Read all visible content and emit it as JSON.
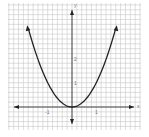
{
  "chart_data": {
    "type": "line",
    "title": "",
    "xlabel": "x",
    "ylabel": "y",
    "function": "y = x^2",
    "x": [
      -1.8,
      -1.5,
      -1.2,
      -1.0,
      -0.8,
      -0.6,
      -0.4,
      -0.2,
      0,
      0.2,
      0.4,
      0.6,
      0.8,
      1.0,
      1.2,
      1.5,
      1.8
    ],
    "series": [
      {
        "name": "y = x^2",
        "values": [
          3.24,
          2.25,
          1.44,
          1.0,
          0.64,
          0.36,
          0.16,
          0.04,
          0,
          0.04,
          0.16,
          0.36,
          0.64,
          1.0,
          1.44,
          2.25,
          3.24
        ]
      }
    ],
    "x_ticks": [
      "-1",
      "1"
    ],
    "y_ticks": [
      "1",
      "2"
    ],
    "xlim": [
      -2.6,
      2.8
    ],
    "ylim": [
      -0.9,
      4.3
    ],
    "grid": true,
    "grid_minor_step": 0.2,
    "arrows_on_curve_ends": true,
    "arrows_on_axes": true,
    "colors": {
      "curve": "#222222",
      "axes": "#333333",
      "grid": "#c8c8c8"
    }
  },
  "labels": {
    "x_axis": "x",
    "y_axis": "y",
    "x_tick_neg1": "-1",
    "x_tick_1": "1",
    "y_tick_1": "1",
    "y_tick_2": "2"
  }
}
